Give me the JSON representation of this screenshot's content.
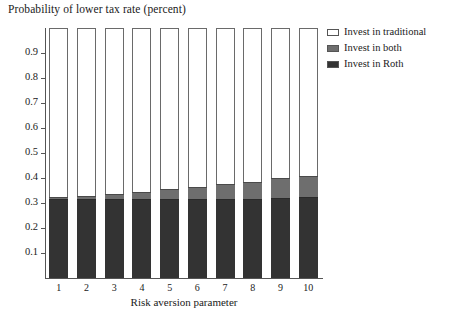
{
  "chart_data": {
    "type": "bar",
    "subtype": "stacked-100-percent",
    "title": "Probability of lower tax rate (percent)",
    "xlabel": "Risk aversion parameter",
    "ylabel": "",
    "categories": [
      "1",
      "2",
      "3",
      "4",
      "5",
      "6",
      "7",
      "8",
      "9",
      "10"
    ],
    "ylim": [
      0,
      1
    ],
    "yticks": [
      "0.1",
      "0.2",
      "0.3",
      "0.4",
      "0.5",
      "0.6",
      "0.7",
      "0.8",
      "0.9"
    ],
    "ytick_values": [
      0.1,
      0.2,
      0.3,
      0.4,
      0.5,
      0.6,
      0.7,
      0.8,
      0.9
    ],
    "grid": false,
    "legend_position": "top-right",
    "series": [
      {
        "name": "Invest in traditional",
        "color": "#ffffff",
        "values": [
          0.675,
          0.67,
          0.665,
          0.655,
          0.645,
          0.635,
          0.625,
          0.615,
          0.6,
          0.59
        ]
      },
      {
        "name": "Invest in both",
        "color": "#6e6e6e",
        "values": [
          0.01,
          0.015,
          0.02,
          0.03,
          0.04,
          0.05,
          0.06,
          0.07,
          0.08,
          0.085
        ]
      },
      {
        "name": "Invest in Roth",
        "color": "#333333",
        "values": [
          0.315,
          0.315,
          0.315,
          0.315,
          0.315,
          0.315,
          0.315,
          0.315,
          0.32,
          0.325
        ]
      }
    ],
    "cumulative_tops": {
      "roth": [
        0.315,
        0.315,
        0.315,
        0.315,
        0.315,
        0.315,
        0.315,
        0.315,
        0.32,
        0.325
      ],
      "both": [
        0.325,
        0.33,
        0.335,
        0.345,
        0.355,
        0.365,
        0.375,
        0.385,
        0.4,
        0.41
      ],
      "traditional": [
        1.0,
        1.0,
        1.0,
        1.0,
        1.0,
        1.0,
        1.0,
        1.0,
        1.0,
        1.0
      ]
    }
  },
  "legend": {
    "items": [
      {
        "label": "Invest in traditional",
        "color": "#ffffff"
      },
      {
        "label": "Invest in both",
        "color": "#6e6e6e"
      },
      {
        "label": "Invest in Roth",
        "color": "#333333"
      }
    ]
  }
}
